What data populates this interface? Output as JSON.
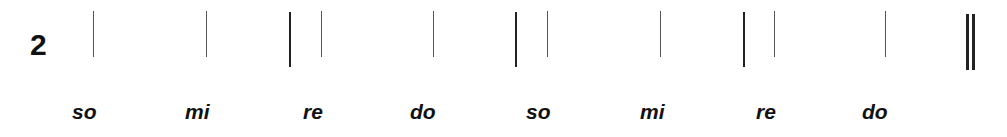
{
  "exercise": {
    "number": "2",
    "syllables": [
      "so",
      "mi",
      "re",
      "do",
      "so",
      "mi",
      "re",
      "do"
    ]
  }
}
